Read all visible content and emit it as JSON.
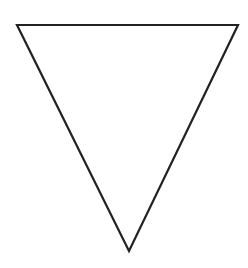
{
  "diagram": {
    "shape": "inverted-triangle",
    "background": "#ffffff",
    "stroke": "#222222",
    "stroke_width": 2.2,
    "fill": "#ffffff",
    "vertices": {
      "top_left": [
        17,
        25
      ],
      "top_right": [
        238,
        25
      ],
      "bottom": [
        129,
        251
      ]
    }
  }
}
